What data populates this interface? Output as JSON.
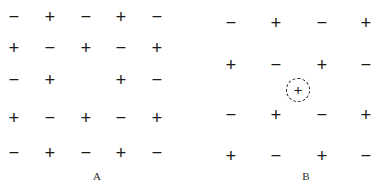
{
  "figure": {
    "background_color": "#ffffff",
    "symbol_color": "#1a1a1a",
    "glyphs": {
      "cation": "+",
      "anion": "−",
      "vacancy": ""
    }
  },
  "panels": [
    {
      "id": "A",
      "label": "A",
      "label_x": 85,
      "label_y": 170,
      "defect_type": "vacancy",
      "columns_x": [
        5,
        41,
        77,
        112,
        148
      ],
      "rows_y": [
        8,
        39,
        71,
        109,
        144
      ],
      "grid": [
        [
          "−",
          "+",
          "−",
          "+",
          "−"
        ],
        [
          "+",
          "−",
          "+",
          "−",
          "+"
        ],
        [
          "−",
          "+",
          "",
          "+",
          "−"
        ],
        [
          "+",
          "−",
          "+",
          "−",
          "+"
        ],
        [
          "−",
          "+",
          "−",
          "+",
          "−"
        ]
      ]
    },
    {
      "id": "B",
      "label": "B",
      "label_x": 294,
      "label_y": 170,
      "defect_type": "interstitial",
      "columns_x": [
        222,
        267,
        313,
        357
      ],
      "rows_y": [
        14,
        56,
        106,
        147
      ],
      "grid": [
        [
          "−",
          "+",
          "−",
          "+"
        ],
        [
          "+",
          "−",
          "+",
          "−"
        ],
        [
          "−",
          "+",
          "−",
          "+"
        ],
        [
          "+",
          "−",
          "+",
          "−"
        ]
      ],
      "interstitial": {
        "glyph": "+",
        "center_x": 298,
        "center_y": 90,
        "radius": 12
      }
    }
  ]
}
